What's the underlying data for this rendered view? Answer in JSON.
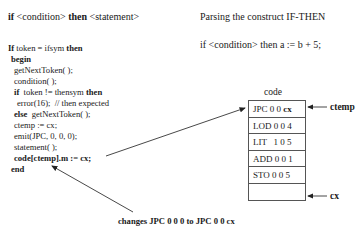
{
  "header": {
    "construct_prefix": "if",
    "construct_condition": " <condition> ",
    "construct_then": "then",
    "construct_statement": " <statement>",
    "title": "Parsing the construct IF-THEN",
    "example": "if <condition> then a := b + 5;"
  },
  "code_listing": [
    {
      "indent": 0,
      "parts": [
        {
          "text": "If",
          "bold": true
        },
        {
          "text": " token = ifsym ",
          "bold": false
        },
        {
          "text": "then",
          "bold": true
        }
      ]
    },
    {
      "indent": 1,
      "parts": [
        {
          "text": "begin",
          "bold": true
        }
      ]
    },
    {
      "indent": 2,
      "parts": [
        {
          "text": "getNextToken( );",
          "bold": false
        }
      ]
    },
    {
      "indent": 2,
      "parts": [
        {
          "text": "condition( );",
          "bold": false
        }
      ]
    },
    {
      "indent": 2,
      "parts": [
        {
          "text": "if",
          "bold": true
        },
        {
          "text": "  token != thensym ",
          "bold": false
        },
        {
          "text": "then",
          "bold": true
        }
      ]
    },
    {
      "indent": 3,
      "parts": [
        {
          "text": "error(16);  // then expected",
          "bold": false
        }
      ]
    },
    {
      "indent": 2,
      "parts": [
        {
          "text": "else",
          "bold": true
        },
        {
          "text": "  getNextToken( );",
          "bold": false
        }
      ]
    },
    {
      "indent": 2,
      "parts": [
        {
          "text": "ctemp := cx;",
          "bold": false
        }
      ]
    },
    {
      "indent": 2,
      "parts": [
        {
          "text": "emit(JPC, 0, 0, 0);",
          "bold": false
        }
      ]
    },
    {
      "indent": 2,
      "parts": [
        {
          "text": "statement( );",
          "bold": false
        }
      ]
    },
    {
      "indent": 2,
      "parts": [
        {
          "text": "code[ctemp].m := cx;",
          "bold": true
        }
      ]
    },
    {
      "indent": 1,
      "parts": [
        {
          "text": "end",
          "bold": true
        }
      ]
    }
  ],
  "code_table": {
    "label": "code",
    "rows": [
      {
        "op": "JPC 0 0 ",
        "operand": "cx",
        "operand_bold": true
      },
      {
        "op": "LOD 0 0 4",
        "operand": "",
        "operand_bold": false
      },
      {
        "op": "LIT   1 0 5",
        "operand": "",
        "operand_bold": false
      },
      {
        "op": "ADD 0 0 1",
        "operand": "",
        "operand_bold": false
      },
      {
        "op": "STO 0 0 5",
        "operand": "",
        "operand_bold": false
      },
      {
        "op": "",
        "operand": "",
        "operand_bold": false
      }
    ],
    "pointers": {
      "ctemp": "ctemp",
      "cx": "cx"
    }
  },
  "annotation": "changes JPC 0 0 0 to JPC 0 0 cx"
}
